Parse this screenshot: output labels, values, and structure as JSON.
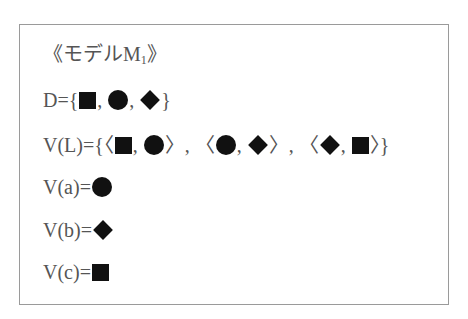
{
  "model": {
    "title_prefix": "《モデルM",
    "title_sub": "1",
    "title_suffix": "》",
    "domain_label": "D={",
    "valuation_L_label": "V(L)={",
    "valuation_a_label": "V(a)=",
    "valuation_b_label": "V(b)=",
    "valuation_c_label": "V(c)=",
    "sep": ", ",
    "open_angle": "〈",
    "close_angle": "〉",
    "close_brace": "}",
    "domain_members": [
      "square",
      "circle",
      "diamond"
    ],
    "L_pairs": [
      [
        "square",
        "circle"
      ],
      [
        "circle",
        "diamond"
      ],
      [
        "diamond",
        "square"
      ]
    ],
    "V_a": "circle",
    "V_b": "diamond",
    "V_c": "square"
  },
  "colors": {
    "text": "#555555",
    "symbol": "#111111",
    "border": "#9a9a9a"
  }
}
